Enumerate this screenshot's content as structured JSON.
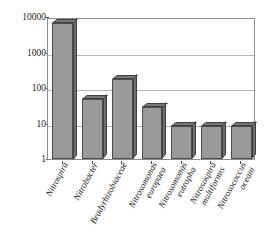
{
  "chart_data": {
    "type": "bar",
    "title": "",
    "xlabel": "",
    "ylabel": "读取的序列数",
    "yscale": "log",
    "ylim": [
      1,
      10000
    ],
    "ytick_labels": [
      "10000",
      "1000",
      "100",
      "10",
      "1"
    ],
    "ytick_values": [
      10000,
      1000,
      100,
      10,
      1
    ],
    "grid": true,
    "legend": false,
    "bar_style": "3d",
    "bar_color": "#9a9a9a",
    "bar_edge_color": "#4d4d4d",
    "categories": [
      "Nitrospira",
      "Nitrobacter",
      "Bradyrhizobiaceae",
      "Nitrosomonas europaea",
      "Nitrosomonas eutropha",
      "Nitrosospira multiformis",
      "Nitrosococcus oceani"
    ],
    "category_lines": [
      [
        "Nitrospira"
      ],
      [
        "Nitrobacter"
      ],
      [
        "Bradyrhizobiaceae"
      ],
      [
        "Nitrosomonas",
        "europaea"
      ],
      [
        "Nitrosomonas",
        "eutropha"
      ],
      [
        "Nitrosospira",
        "multiformis"
      ],
      [
        "Nitrosococcus",
        "oceani"
      ]
    ],
    "values": [
      7000,
      50,
      180,
      30,
      8.5,
      8.5,
      8.5
    ]
  }
}
